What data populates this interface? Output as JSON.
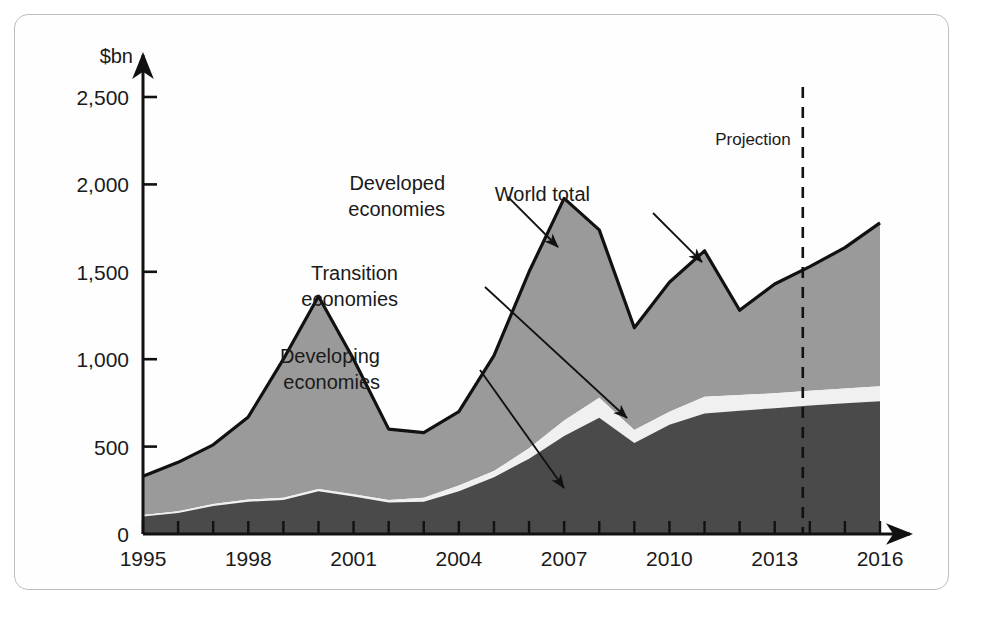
{
  "chart_data": {
    "type": "area",
    "stacked": true,
    "title": "",
    "xlabel": "",
    "ylabel": "$bn",
    "ylim": [
      0,
      2500
    ],
    "xlim": [
      1995,
      2016
    ],
    "grid": false,
    "legend_position": "annotations-on-plot",
    "y_ticks": [
      "0",
      "500",
      "1,000",
      "1,500",
      "2,000",
      "2,500"
    ],
    "y_tick_values": [
      0,
      500,
      1000,
      1500,
      2000,
      2500
    ],
    "x_ticks": [
      "1995",
      "1998",
      "2001",
      "2004",
      "2007",
      "2010",
      "2013",
      "2016"
    ],
    "x_tick_values": [
      1995,
      1998,
      2001,
      2004,
      2007,
      2010,
      2013,
      2016
    ],
    "x": [
      1995,
      1996,
      1997,
      1998,
      1999,
      2000,
      2001,
      2002,
      2003,
      2004,
      2005,
      2006,
      2007,
      2008,
      2009,
      2010,
      2011,
      2012,
      2013,
      2014,
      2015,
      2016
    ],
    "series": [
      {
        "name": "Developing economies",
        "color": "#4a4a4a",
        "values": [
          100,
          120,
          160,
          185,
          195,
          245,
          215,
          180,
          185,
          245,
          325,
          430,
          560,
          665,
          520,
          625,
          690,
          705,
          720,
          735,
          748,
          760
        ]
      },
      {
        "name": "Transition economies",
        "color": "#f0f0f0",
        "values": [
          8,
          10,
          12,
          12,
          12,
          12,
          12,
          14,
          22,
          32,
          35,
          60,
          90,
          115,
          75,
          75,
          95,
          90,
          85,
          85,
          85,
          85
        ]
      },
      {
        "name": "Developed economies",
        "color": "#9a9a9a",
        "values": [
          222,
          280,
          338,
          473,
          793,
          1103,
          773,
          406,
          373,
          423,
          660,
          1010,
          1270,
          960,
          585,
          740,
          835,
          485,
          625,
          710,
          805,
          935
        ]
      }
    ],
    "totals": [
      330,
      410,
      510,
      670,
      1000,
      1360,
      1000,
      600,
      580,
      700,
      1020,
      1500,
      1920,
      1740,
      1180,
      1440,
      1620,
      1280,
      1430,
      1530,
      1638,
      1780
    ],
    "annotations": [
      {
        "id": "developed-economies",
        "label_line1": "Developed",
        "label_line2": "economies",
        "text_x": 430,
        "text_y": 175,
        "leader_x1": 493,
        "leader_y1": 182,
        "leader_x2": 543,
        "leader_y2": 232
      },
      {
        "id": "world-total",
        "label_line1": "World total",
        "label_line2": "",
        "text_x": 575,
        "text_y": 186,
        "leader_x1": 638,
        "leader_y1": 198,
        "leader_x2": 687,
        "leader_y2": 247
      },
      {
        "id": "transition-economies",
        "label_line1": "Transition",
        "label_line2": "economies",
        "text_x": 383,
        "text_y": 265,
        "leader_x1": 470,
        "leader_y1": 272,
        "leader_x2": 612,
        "leader_y2": 403
      },
      {
        "id": "developing-economies",
        "label_line1": "Developing",
        "label_line2": "economies",
        "text_x": 365,
        "text_y": 348,
        "leader_x1": 465,
        "leader_y1": 355,
        "leader_x2": 549,
        "leader_y2": 473
      }
    ],
    "projection": {
      "label": "Projection",
      "divider_year": 2013.8,
      "label_x": 735,
      "label_y": 130
    }
  },
  "colors": {
    "developing": "#4a4a4a",
    "transition": "#f0f0f0",
    "developed": "#9a9a9a",
    "outline": "#111111",
    "axis": "#111111",
    "frame": "#bdbdbd",
    "background": "#fefefe",
    "text": "#1a1a1a"
  }
}
